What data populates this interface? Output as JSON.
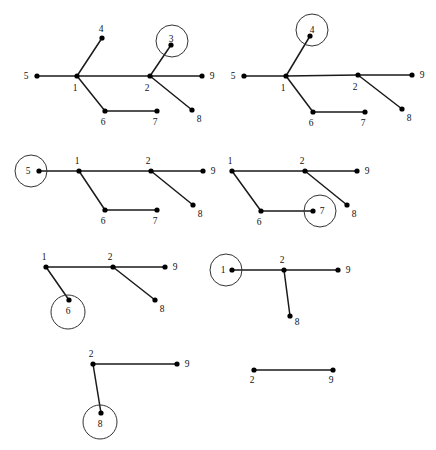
{
  "figure": {
    "title": "",
    "width": 436,
    "height": 450,
    "background": "#ffffff",
    "edge_color": "#1a1a1a",
    "node_color": "#000000",
    "circle_color": "#333333",
    "label_color": "#111111",
    "panels": [
      {
        "id": "panel-1",
        "name": "step-1-full-tree",
        "circled_node": "3",
        "nodes": [
          {
            "id": "5",
            "label": "5",
            "x": 37,
            "y": 76,
            "label_dx": -11,
            "label_dy": 3,
            "circled": false
          },
          {
            "id": "1",
            "label": "1",
            "x": 77,
            "y": 76,
            "label_dx": -2,
            "label_dy": 15,
            "circled": false
          },
          {
            "id": "4",
            "label": "4",
            "x": 102,
            "y": 38,
            "label_dx": -1,
            "label_dy": -6,
            "circled": false
          },
          {
            "id": "2",
            "label": "2",
            "x": 150,
            "y": 76,
            "label_dx": -3,
            "label_dy": 15,
            "circled": false
          },
          {
            "id": "3",
            "label": "3",
            "x": 171,
            "y": 45,
            "label_dx": 0,
            "label_dy": -3,
            "circled": true,
            "circle_cx": 172,
            "circle_cy": 41,
            "circle_r": 16
          },
          {
            "id": "9",
            "label": "9",
            "x": 202,
            "y": 76,
            "label_dx": 10,
            "label_dy": 3,
            "circled": false
          },
          {
            "id": "8",
            "label": "8",
            "x": 192,
            "y": 110,
            "label_dx": 7,
            "label_dy": 12,
            "circled": false
          },
          {
            "id": "6",
            "label": "6",
            "x": 105,
            "y": 111,
            "label_dx": -2,
            "label_dy": 14,
            "circled": false
          },
          {
            "id": "7",
            "label": "7",
            "x": 157,
            "y": 111,
            "label_dx": -2,
            "label_dy": 14,
            "circled": false
          }
        ],
        "edges": [
          [
            "5",
            "1"
          ],
          [
            "1",
            "4"
          ],
          [
            "1",
            "2"
          ],
          [
            "1",
            "6"
          ],
          [
            "2",
            "3"
          ],
          [
            "2",
            "9"
          ],
          [
            "2",
            "8"
          ],
          [
            "6",
            "7"
          ]
        ]
      },
      {
        "id": "panel-2",
        "name": "step-2-remove-4",
        "circled_node": "4",
        "nodes": [
          {
            "id": "5",
            "label": "5",
            "x": 244,
            "y": 76,
            "label_dx": -11,
            "label_dy": 3,
            "circled": false
          },
          {
            "id": "1",
            "label": "1",
            "x": 286,
            "y": 76,
            "label_dx": -3,
            "label_dy": 15,
            "circled": false
          },
          {
            "id": "4",
            "label": "4",
            "x": 310,
            "y": 36,
            "label_dx": 2,
            "label_dy": -3,
            "circled": true,
            "circle_cx": 312,
            "circle_cy": 30,
            "circle_r": 16
          },
          {
            "id": "2",
            "label": "2",
            "x": 358,
            "y": 75,
            "label_dx": -3,
            "label_dy": 15,
            "circled": false
          },
          {
            "id": "9",
            "label": "9",
            "x": 412,
            "y": 75,
            "label_dx": 10,
            "label_dy": 3,
            "circled": false
          },
          {
            "id": "8",
            "label": "8",
            "x": 402,
            "y": 109,
            "label_dx": 7,
            "label_dy": 12,
            "circled": false
          },
          {
            "id": "6",
            "label": "6",
            "x": 313,
            "y": 112,
            "label_dx": -2,
            "label_dy": 14,
            "circled": false
          },
          {
            "id": "7",
            "label": "7",
            "x": 365,
            "y": 112,
            "label_dx": -2,
            "label_dy": 14,
            "circled": false
          }
        ],
        "edges": [
          [
            "5",
            "1"
          ],
          [
            "1",
            "4"
          ],
          [
            "1",
            "2"
          ],
          [
            "1",
            "6"
          ],
          [
            "2",
            "9"
          ],
          [
            "2",
            "8"
          ],
          [
            "6",
            "7"
          ]
        ]
      },
      {
        "id": "panel-3",
        "name": "step-3-remove-5",
        "circled_node": "5",
        "nodes": [
          {
            "id": "5",
            "label": "5",
            "x": 39,
            "y": 171,
            "label_dx": -11,
            "label_dy": 3,
            "circled": true,
            "circle_cx": 31,
            "circle_cy": 171,
            "circle_r": 16
          },
          {
            "id": "1",
            "label": "1",
            "x": 79,
            "y": 171,
            "label_dx": -2,
            "label_dy": -7,
            "circled": false
          },
          {
            "id": "2",
            "label": "2",
            "x": 151,
            "y": 171,
            "label_dx": -3,
            "label_dy": -7,
            "circled": false
          },
          {
            "id": "9",
            "label": "9",
            "x": 203,
            "y": 171,
            "label_dx": 10,
            "label_dy": 3,
            "circled": false
          },
          {
            "id": "8",
            "label": "8",
            "x": 193,
            "y": 205,
            "label_dx": 7,
            "label_dy": 12,
            "circled": false
          },
          {
            "id": "6",
            "label": "6",
            "x": 105,
            "y": 210,
            "label_dx": -2,
            "label_dy": 14,
            "circled": false
          },
          {
            "id": "7",
            "label": "7",
            "x": 157,
            "y": 210,
            "label_dx": -2,
            "label_dy": 14,
            "circled": false
          }
        ],
        "edges": [
          [
            "5",
            "1"
          ],
          [
            "1",
            "2"
          ],
          [
            "1",
            "6"
          ],
          [
            "2",
            "9"
          ],
          [
            "2",
            "8"
          ],
          [
            "6",
            "7"
          ]
        ]
      },
      {
        "id": "panel-4",
        "name": "step-4-remove-7",
        "circled_node": "7",
        "nodes": [
          {
            "id": "1",
            "label": "1",
            "x": 232,
            "y": 171,
            "label_dx": -2,
            "label_dy": -7,
            "circled": false
          },
          {
            "id": "2",
            "label": "2",
            "x": 305,
            "y": 171,
            "label_dx": -3,
            "label_dy": -7,
            "circled": false
          },
          {
            "id": "9",
            "label": "9",
            "x": 357,
            "y": 171,
            "label_dx": 10,
            "label_dy": 3,
            "circled": false
          },
          {
            "id": "8",
            "label": "8",
            "x": 347,
            "y": 205,
            "label_dx": 7,
            "label_dy": 12,
            "circled": false
          },
          {
            "id": "6",
            "label": "6",
            "x": 261,
            "y": 211,
            "label_dx": -2,
            "label_dy": 14,
            "circled": false
          },
          {
            "id": "7",
            "label": "7",
            "x": 313,
            "y": 211,
            "label_dx": 9,
            "label_dy": 3,
            "circled": true,
            "circle_cx": 320,
            "circle_cy": 211,
            "circle_r": 16
          }
        ],
        "edges": [
          [
            "1",
            "2"
          ],
          [
            "1",
            "6"
          ],
          [
            "2",
            "9"
          ],
          [
            "2",
            "8"
          ],
          [
            "6",
            "7"
          ]
        ]
      },
      {
        "id": "panel-5",
        "name": "step-5-remove-6",
        "circled_node": "6",
        "nodes": [
          {
            "id": "1",
            "label": "1",
            "x": 46,
            "y": 267,
            "label_dx": -2,
            "label_dy": -7,
            "circled": false
          },
          {
            "id": "2",
            "label": "2",
            "x": 113,
            "y": 267,
            "label_dx": -3,
            "label_dy": -7,
            "circled": false
          },
          {
            "id": "9",
            "label": "9",
            "x": 165,
            "y": 267,
            "label_dx": 10,
            "label_dy": 3,
            "circled": false
          },
          {
            "id": "8",
            "label": "8",
            "x": 155,
            "y": 300,
            "label_dx": 7,
            "label_dy": 12,
            "circled": false
          },
          {
            "id": "6",
            "label": "6",
            "x": 69,
            "y": 300,
            "label_dx": -1,
            "label_dy": 14,
            "circled": true,
            "circle_cx": 68,
            "circle_cy": 312,
            "circle_r": 17
          }
        ],
        "edges": [
          [
            "1",
            "2"
          ],
          [
            "1",
            "6"
          ],
          [
            "2",
            "9"
          ],
          [
            "2",
            "8"
          ]
        ]
      },
      {
        "id": "panel-6",
        "name": "step-6-remove-1",
        "circled_node": "1",
        "nodes": [
          {
            "id": "1",
            "label": "1",
            "x": 232,
            "y": 270,
            "label_dx": -9,
            "label_dy": 3,
            "circled": true,
            "circle_cx": 226,
            "circle_cy": 270,
            "circle_r": 16
          },
          {
            "id": "2",
            "label": "2",
            "x": 284,
            "y": 270,
            "label_dx": -2,
            "label_dy": -7,
            "circled": false
          },
          {
            "id": "9",
            "label": "9",
            "x": 338,
            "y": 270,
            "label_dx": 10,
            "label_dy": 3,
            "circled": false
          },
          {
            "id": "8",
            "label": "8",
            "x": 290,
            "y": 316,
            "label_dx": 7,
            "label_dy": 9,
            "circled": false
          }
        ],
        "edges": [
          [
            "1",
            "2"
          ],
          [
            "2",
            "9"
          ],
          [
            "2",
            "8"
          ]
        ]
      },
      {
        "id": "panel-7",
        "name": "step-7-remove-8",
        "circled_node": "8",
        "nodes": [
          {
            "id": "2",
            "label": "2",
            "x": 93,
            "y": 364,
            "label_dx": -2,
            "label_dy": -7,
            "circled": false
          },
          {
            "id": "9",
            "label": "9",
            "x": 177,
            "y": 364,
            "label_dx": 10,
            "label_dy": 3,
            "circled": false
          },
          {
            "id": "8",
            "label": "8",
            "x": 101,
            "y": 413,
            "label_dx": -1,
            "label_dy": 14,
            "circled": true,
            "circle_cx": 100,
            "circle_cy": 422,
            "circle_r": 17
          }
        ],
        "edges": [
          [
            "2",
            "9"
          ],
          [
            "2",
            "8"
          ]
        ]
      },
      {
        "id": "panel-8",
        "name": "step-8-final-edge",
        "circled_node": "",
        "nodes": [
          {
            "id": "2",
            "label": "2",
            "x": 254,
            "y": 370,
            "label_dx": -2,
            "label_dy": 13,
            "circled": false
          },
          {
            "id": "9",
            "label": "9",
            "x": 333,
            "y": 370,
            "label_dx": -2,
            "label_dy": 13,
            "circled": false
          }
        ],
        "edges": [
          [
            "2",
            "9"
          ]
        ]
      }
    ]
  }
}
